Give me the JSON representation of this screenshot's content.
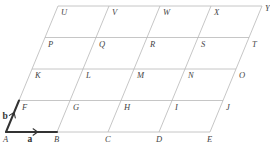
{
  "diagram": {
    "type": "parallelogram-lattice",
    "rows": 4,
    "cols": 4,
    "line_color": "#b8b8b8",
    "vector_color": "#333333",
    "origin": [
      6,
      132
    ],
    "a_step": [
      51,
      0
    ],
    "b_step": [
      13,
      -31.5
    ],
    "points": [
      {
        "name": "A",
        "i": 0,
        "j": 0
      },
      {
        "name": "B",
        "i": 1,
        "j": 0
      },
      {
        "name": "C",
        "i": 2,
        "j": 0
      },
      {
        "name": "D",
        "i": 3,
        "j": 0
      },
      {
        "name": "E",
        "i": 4,
        "j": 0
      },
      {
        "name": "F",
        "i": 0,
        "j": 1
      },
      {
        "name": "G",
        "i": 1,
        "j": 1
      },
      {
        "name": "H",
        "i": 2,
        "j": 1
      },
      {
        "name": "I",
        "i": 3,
        "j": 1
      },
      {
        "name": "J",
        "i": 4,
        "j": 1
      },
      {
        "name": "K",
        "i": 0,
        "j": 2
      },
      {
        "name": "L",
        "i": 1,
        "j": 2
      },
      {
        "name": "M",
        "i": 2,
        "j": 2
      },
      {
        "name": "N",
        "i": 3,
        "j": 2
      },
      {
        "name": "O",
        "i": 4,
        "j": 2
      },
      {
        "name": "P",
        "i": 0,
        "j": 3
      },
      {
        "name": "Q",
        "i": 1,
        "j": 3
      },
      {
        "name": "R",
        "i": 2,
        "j": 3
      },
      {
        "name": "S",
        "i": 3,
        "j": 3
      },
      {
        "name": "T",
        "i": 4,
        "j": 3
      },
      {
        "name": "U",
        "i": 0,
        "j": 4
      },
      {
        "name": "V",
        "i": 1,
        "j": 4
      },
      {
        "name": "W",
        "i": 2,
        "j": 4
      },
      {
        "name": "X",
        "i": 3,
        "j": 4
      },
      {
        "name": "Y",
        "i": 4,
        "j": 4
      }
    ],
    "vectors": [
      {
        "name": "a",
        "from": "A",
        "to": "B"
      },
      {
        "name": "b",
        "from": "A",
        "to": "F"
      }
    ]
  }
}
